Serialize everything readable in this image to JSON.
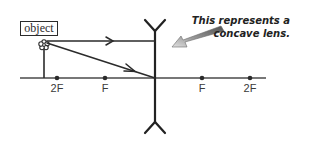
{
  "diagram": {
    "object_label": "object",
    "annotation": {
      "line1": "This represents a",
      "line2": "concave lens."
    },
    "axis_points": [
      {
        "label": "2F",
        "side": "left",
        "x": 57
      },
      {
        "label": "F",
        "side": "left",
        "x": 105
      },
      {
        "label": "F",
        "side": "right",
        "x": 202
      },
      {
        "label": "2F",
        "side": "right",
        "x": 250
      }
    ],
    "lens": {
      "type": "concave",
      "x": 155,
      "top": 20,
      "bottom": 135
    },
    "object": {
      "x": 44,
      "base_y": 78,
      "top_y": 44
    },
    "rays": [
      {
        "name": "parallel-ray",
        "from": [
          47,
          41
        ],
        "to": [
          155,
          41
        ]
      },
      {
        "name": "center-ray",
        "from": [
          47,
          43
        ],
        "to": [
          155,
          78
        ]
      }
    ],
    "colors": {
      "line": "#2b2b2b",
      "axis": "#4a4a4a",
      "arrow_gradient_start": "#5a5a5a",
      "arrow_gradient_end": "#d8d8d8"
    }
  }
}
